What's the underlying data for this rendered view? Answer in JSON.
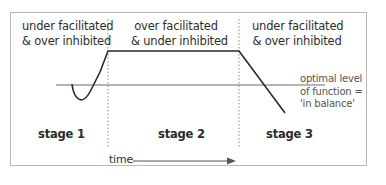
{
  "diagram": {
    "regions": [
      {
        "header_line1": "under facilitated",
        "header_line2": "& over inhibited",
        "stage": "stage 1"
      },
      {
        "header_line1": "over facilitated",
        "header_line2": "& under inhibited",
        "stage": "stage 2"
      },
      {
        "header_line1": "under facilitated",
        "header_line2": "& over inhibited",
        "stage": "stage 3"
      }
    ],
    "baseline_label": {
      "line1": "optimal level",
      "line2": "of function =",
      "line3": "'in balance'"
    },
    "time_axis": {
      "label": "time",
      "direction": "right"
    },
    "colors": {
      "curve": "#2b2b2b",
      "baseline": "#6b6b6b",
      "divider": "#8a8a8a",
      "frame": "#b9b9b9",
      "arrow": "#555555"
    }
  }
}
